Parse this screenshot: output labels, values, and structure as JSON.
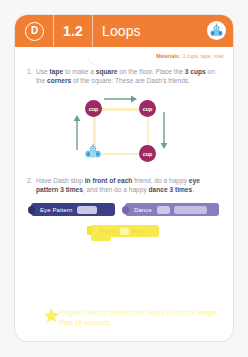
{
  "header": {
    "badge_letter": "D",
    "lesson_number": "1.2",
    "lesson_title": "Loops",
    "robot_icon": "dash-robot-icon",
    "bg_color": "#f07f34"
  },
  "materials": {
    "label": "Materials:",
    "value": "3 cups, tape, ruler"
  },
  "steps": [
    {
      "number": "1.",
      "parts": [
        {
          "text": "Use ",
          "bold": false
        },
        {
          "text": "tape",
          "bold": true
        },
        {
          "text": " to make a ",
          "bold": false
        },
        {
          "text": "square",
          "bold": true
        },
        {
          "text": " on the floor. Place the ",
          "bold": false
        },
        {
          "text": "3 cups",
          "bold": true
        },
        {
          "text": " on the ",
          "bold": false
        },
        {
          "text": "corners",
          "bold": true
        },
        {
          "text": " of the square. These are Dash's friends.",
          "bold": false
        }
      ]
    },
    {
      "number": "2.",
      "parts": [
        {
          "text": "Have Dash stop ",
          "bold": false
        },
        {
          "text": "in front of each",
          "bold": true
        },
        {
          "text": " friend, do a happy ",
          "bold": false
        },
        {
          "text": "eye pattern 3 times",
          "bold": true
        },
        {
          "text": ", and then do a happy ",
          "bold": false
        },
        {
          "text": "dance 3 times",
          "bold": true
        },
        {
          "text": ".",
          "bold": false
        }
      ]
    }
  ],
  "diagram": {
    "cup_label": "cup",
    "cup_color": "#9e2a64",
    "path_color": "#fbeec4",
    "arrow_color": "#6aa08c",
    "cups": [
      {
        "name": "cup-top-left"
      },
      {
        "name": "cup-top-right"
      },
      {
        "name": "cup-bottom-right"
      }
    ],
    "robot": "dash-robot-icon",
    "arrows": [
      "arrow-right",
      "arrow-down",
      "arrow-up"
    ]
  },
  "blocks": {
    "eye_pattern": {
      "label": "Eye Pattern",
      "color": "#3c3f86",
      "fields": 1
    },
    "dance": {
      "label": "Dance",
      "color": "#8b7cc0",
      "fields": 2
    },
    "repeat": {
      "label_start": "Repeat",
      "label_end": "times",
      "color": "#f7e94e"
    }
  },
  "challenge": {
    "icon": "star-icon",
    "parts": [
      {
        "text": "Program Dash to perform the Happy Dance for ",
        "bold": false
      },
      {
        "text": "longer than 10 seconds",
        "bold": true
      },
      {
        "text": ".",
        "bold": false
      }
    ],
    "color": "#fdf6a4"
  }
}
